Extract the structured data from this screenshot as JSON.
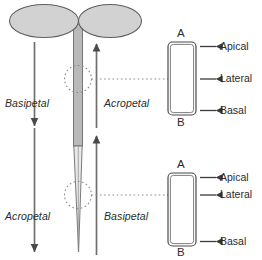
{
  "figure": {
    "colors": {
      "stroke": "#5a5a5a",
      "stroke_dark": "#3a3a3a",
      "text": "#2b2b2b",
      "organ_fill": "#d2d2d2",
      "stem_fill": "#b9b9b9",
      "background": "#ffffff"
    }
  },
  "panels": [
    {
      "id": "upper",
      "name": "shoot-panel",
      "left_flow": {
        "label": "Basipetal",
        "direction": "down"
      },
      "right_flow": {
        "label": "Acropetal",
        "direction": "up"
      },
      "cell": {
        "name": "shoot-cell",
        "top_pole": "A",
        "bottom_pole": "B",
        "sides": [
          "Apical",
          "Lateral",
          "Basal"
        ]
      }
    },
    {
      "id": "lower",
      "name": "root-panel",
      "left_flow": {
        "label": "Acropetal",
        "direction": "down"
      },
      "right_flow": {
        "label": "Basipetal",
        "direction": "up"
      },
      "cell": {
        "name": "root-cell",
        "top_pole": "A",
        "bottom_pole": "B",
        "sides": [
          "Apical",
          "Lateral",
          "Basal"
        ]
      }
    }
  ],
  "plant": {
    "cotyledon_left": "cotyledon-left",
    "cotyledon_right": "cotyledon-right",
    "stem": "hypocotyl",
    "root": "root-taper"
  },
  "callouts": {
    "upper_leader": "upper-cell-leader",
    "lower_leader": "lower-cell-leader"
  }
}
